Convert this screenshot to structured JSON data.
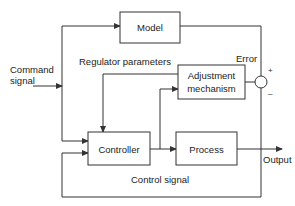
{
  "diagram": {
    "blocks": {
      "model": "Model",
      "adjustment_line1": "Adjustment",
      "adjustment_line2": "mechanism",
      "controller": "Controller",
      "process": "Process"
    },
    "labels": {
      "command_line1": "Command",
      "command_line2": "signal",
      "regulator_parameters": "Regulator parameters",
      "error": "Error",
      "plus": "+",
      "minus": "–",
      "output": "Output",
      "control_signal": "Control signal"
    },
    "colors": {
      "line": "#333333",
      "text": "#222222",
      "background": "#ffffff"
    }
  }
}
